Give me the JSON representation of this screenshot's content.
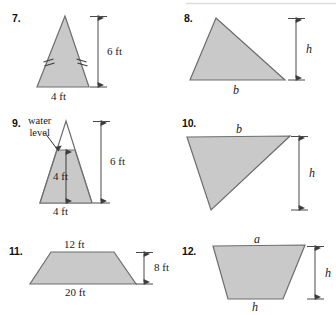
{
  "page": {
    "background_color": "#ffffff",
    "shape_fill_color": "#c9c9c9",
    "shape_stroke_color": "#6e6e6e",
    "dimension_line_color": "#4a4a4a",
    "top_rule_color": "#d9d9d9"
  },
  "problems": [
    {
      "number": "7.",
      "shape": "isosceles-triangle",
      "labels": {
        "height": "6 ft",
        "base": "4 ft"
      }
    },
    {
      "number": "8.",
      "shape": "scalene-triangle",
      "labels": {
        "height": "h",
        "base": "b"
      }
    },
    {
      "number": "9.",
      "shape": "triangle-with-water-level",
      "labels": {
        "callout_line1": "water",
        "callout_line2": "level",
        "total_height": "6 ft",
        "water_depth": "4 ft",
        "base": "4 ft"
      }
    },
    {
      "number": "10.",
      "shape": "right-triangle",
      "labels": {
        "height": "h",
        "base": "b"
      }
    },
    {
      "number": "11.",
      "shape": "trapezoid",
      "labels": {
        "top_base": "12 ft",
        "bottom_base": "20 ft",
        "height": "8 ft"
      }
    },
    {
      "number": "12.",
      "shape": "inverted-trapezoid",
      "labels": {
        "top_base": "a",
        "bottom_base": "h",
        "height": "h"
      }
    }
  ]
}
